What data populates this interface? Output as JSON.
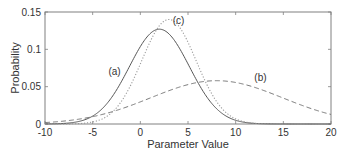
{
  "chart_data": {
    "type": "line",
    "title": "",
    "xlabel": "Parameter Value",
    "ylabel": "Probability",
    "xlim": [
      -10,
      20
    ],
    "ylim": [
      0,
      0.15
    ],
    "xticks": [
      -10,
      -5,
      0,
      5,
      10,
      15,
      20
    ],
    "yticks": [
      0,
      0.05,
      0.1,
      0.15
    ],
    "xtick_labels": [
      "-10",
      "-5",
      "0",
      "5",
      "10",
      "15",
      "20"
    ],
    "ytick_labels": [
      "0",
      "0.05",
      "0.1",
      "0.15"
    ],
    "grid": false,
    "legend": null,
    "series": [
      {
        "name": "(a)",
        "style": "solid",
        "color": "#555555",
        "distribution": "gaussian",
        "mean": 2,
        "std": 3.14,
        "peak": 0.127,
        "x": [
          -10,
          -7.5,
          -5,
          -2.5,
          0,
          2,
          4,
          6,
          8,
          10,
          12.5,
          15,
          20
        ],
        "values": [
          0.0006,
          0.0013,
          0.0106,
          0.0455,
          0.1034,
          0.127,
          0.1034,
          0.055,
          0.0204,
          0.005,
          0.0005,
          0.0001,
          0.0
        ]
      },
      {
        "name": "(b)",
        "style": "dashed",
        "color": "#777777",
        "distribution": "gaussian",
        "mean": 8,
        "std": 6.9,
        "peak": 0.058,
        "x": [
          -10,
          -7.5,
          -5,
          -2.5,
          0,
          2.5,
          5,
          8,
          10,
          12.5,
          15,
          17.5,
          20
        ],
        "values": [
          0.0037,
          0.0071,
          0.0137,
          0.0229,
          0.0297,
          0.0412,
          0.0526,
          0.058,
          0.0555,
          0.046,
          0.0347,
          0.0225,
          0.0127
        ]
      },
      {
        "name": "(c)",
        "style": "dotted",
        "color": "#999999",
        "distribution": "gaussian",
        "mean": 3,
        "std": 2.85,
        "peak": 0.14,
        "x": [
          -10,
          -5,
          -2.5,
          0,
          3,
          5,
          7.5,
          10,
          12.5,
          15,
          20
        ],
        "values": [
          0.0,
          0.0027,
          0.0212,
          0.0804,
          0.14,
          0.1087,
          0.0398,
          0.0068,
          0.0002,
          0.0,
          0.0
        ]
      }
    ],
    "annotations": [
      {
        "text": "(a)",
        "x": -2.7,
        "y": 0.066
      },
      {
        "text": "(b)",
        "x": 12.6,
        "y": 0.058
      },
      {
        "text": "(c)",
        "x": 4.0,
        "y": 0.134
      }
    ]
  }
}
